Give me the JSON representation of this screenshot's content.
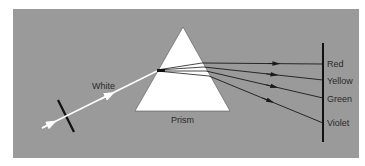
{
  "diagram": {
    "incident_label": "White",
    "prism_label": "Prism",
    "spectrum_labels": [
      "Red",
      "Yellow",
      "Green",
      "Violet"
    ],
    "colors": {
      "background": "#9a9a9a",
      "prism": "#ffffff",
      "incident_ray": "#ffffff",
      "rays": "#1a1a1a",
      "screen": "#111111",
      "text": "#2a2a2a"
    }
  }
}
